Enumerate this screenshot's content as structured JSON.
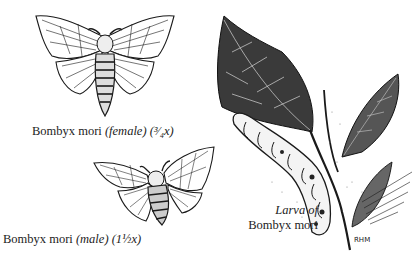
{
  "figures": {
    "female_moth": {
      "species": "Bombyx mori",
      "qualifier": "(female)",
      "scale": "(3/4x)",
      "scale_display": "(³⁄₄x)"
    },
    "male_moth": {
      "species": "Bombyx mori",
      "qualifier": "(male)",
      "scale": "(1 1/2x)",
      "scale_display": "(1½x)"
    },
    "larva": {
      "caption_line1": "Larva of",
      "caption_line2": "Bombyx mori"
    },
    "signature": "RHM"
  },
  "colors": {
    "ink": "#1a1a1a",
    "paper": "#ffffff"
  }
}
